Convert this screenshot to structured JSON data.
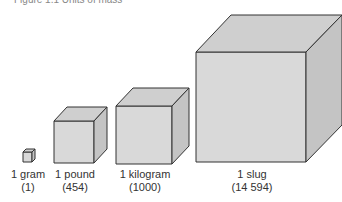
{
  "header": {
    "cut_off_text": "Figure 1.1 Units of mass"
  },
  "cubes": [
    {
      "name": "1 gram",
      "value": "(1)"
    },
    {
      "name": "1 pound",
      "value": "(454)"
    },
    {
      "name": "1 kilogram",
      "value": "(1000)"
    },
    {
      "name": "1 slug",
      "value": "(14 594)"
    }
  ],
  "colors": {
    "front": "#d9d9d9",
    "top": "#cfcfcf",
    "side": "#c4c4c4",
    "edge": "#333333"
  }
}
